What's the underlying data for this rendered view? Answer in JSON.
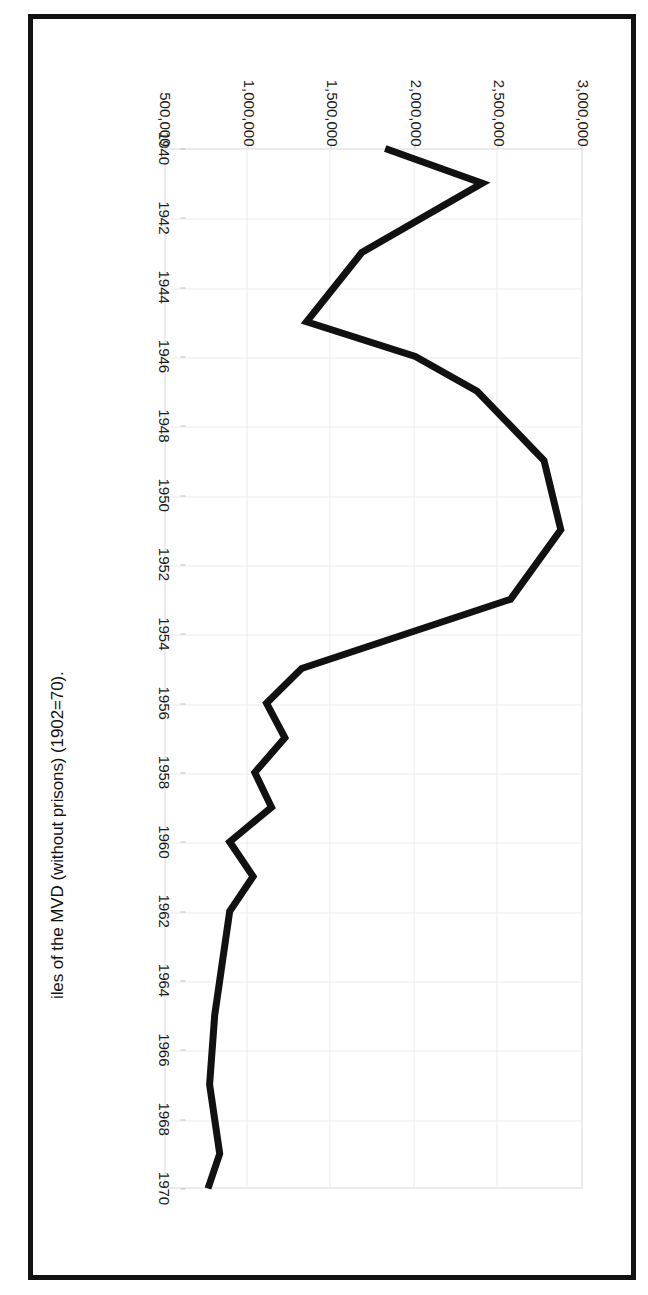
{
  "figure": {
    "title": "iles of the MVD (without prisons) (1902=70)."
  },
  "chart_data": {
    "type": "line",
    "title": "iles of the MVD (without prisons) (1902=70).",
    "xlabel": "",
    "ylabel": "",
    "xlim": [
      1940,
      1970
    ],
    "ylim": [
      500000,
      3000000
    ],
    "grid": true,
    "legend": "none",
    "line_color": "#111111",
    "x_ticks": [
      1940,
      1942,
      1944,
      1946,
      1948,
      1950,
      1952,
      1954,
      1956,
      1958,
      1960,
      1962,
      1964,
      1966,
      1968,
      1970
    ],
    "y_ticks": [
      500000,
      1000000,
      1500000,
      2000000,
      2500000,
      3000000
    ],
    "y_tick_labels": [
      "500,000",
      "1,000,000",
      "1,500,000",
      "2,000,000",
      "2,500,000",
      "3,000,000"
    ],
    "x": [
      1940,
      1941,
      1942,
      1943,
      1944,
      1945,
      1946,
      1947,
      1948,
      1949,
      1950,
      1951,
      1952,
      1953,
      1954,
      1955,
      1956,
      1957,
      1958,
      1959,
      1960,
      1961,
      1962,
      1963,
      1964,
      1965,
      1966,
      1967,
      1968,
      1969,
      1970
    ],
    "values": [
      1820000,
      2400000,
      2400000,
      1680000,
      1680000,
      1350000,
      1350000,
      2370000,
      2370000,
      2770000,
      2770000,
      2870000,
      2870000,
      2570000,
      2570000,
      1320000,
      1320000,
      1110000,
      1110000,
      1220000,
      1220000,
      890000,
      890000,
      1030000,
      1030000,
      890000,
      890000,
      800000,
      800000,
      770000,
      770000
    ],
    "series": [
      {
        "name": "Files of the MVD (without prisons)",
        "points": [
          {
            "year": 1940,
            "value": 1820000
          },
          {
            "year": 1941,
            "value": 2400000
          },
          {
            "year": 1943,
            "value": 1680000
          },
          {
            "year": 1945,
            "value": 1350000
          },
          {
            "year": 1946,
            "value": 2000000
          },
          {
            "year": 1947,
            "value": 2370000
          },
          {
            "year": 1949,
            "value": 2770000
          },
          {
            "year": 1951,
            "value": 2870000
          },
          {
            "year": 1953,
            "value": 2570000
          },
          {
            "year": 1955,
            "value": 1320000
          },
          {
            "year": 1956,
            "value": 1110000
          },
          {
            "year": 1957,
            "value": 1220000
          },
          {
            "year": 1958,
            "value": 1040000
          },
          {
            "year": 1959,
            "value": 1140000
          },
          {
            "year": 1960,
            "value": 890000
          },
          {
            "year": 1961,
            "value": 1030000
          },
          {
            "year": 1962,
            "value": 890000
          },
          {
            "year": 1965,
            "value": 800000
          },
          {
            "year": 1967,
            "value": 770000
          },
          {
            "year": 1969,
            "value": 830000
          },
          {
            "year": 1970,
            "value": 760000
          }
        ]
      }
    ]
  }
}
